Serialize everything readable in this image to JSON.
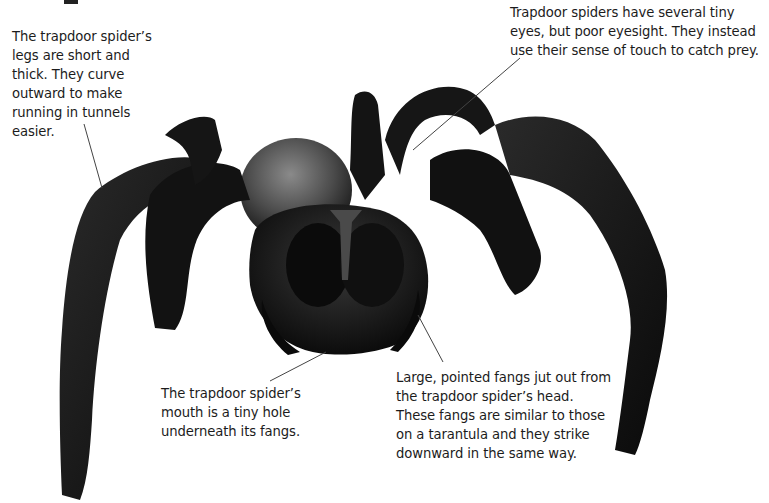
{
  "figure": {
    "colors": {
      "background": "#ffffff",
      "spider_body": "#141414",
      "abdomen": "#5a5a5a",
      "leader_line": "#333333",
      "text": "#1c1c1c"
    }
  },
  "callouts": {
    "legs": {
      "text": "The trapdoor spider’s legs are short and thick.  They curve outward to make running in tunnels easier."
    },
    "eyes": {
      "text": "Trapdoor spiders have several tiny eyes, but poor eyesight.  They instead use their sense of touch to catch prey."
    },
    "mouth": {
      "text": "The trapdoor spider’s mouth is a tiny hole underneath its fangs."
    },
    "fangs": {
      "text": "Large, pointed fangs jut out from the trapdoor spider’s head.  These fangs are similar to those on a tarantula and they strike downward in the same way."
    }
  }
}
